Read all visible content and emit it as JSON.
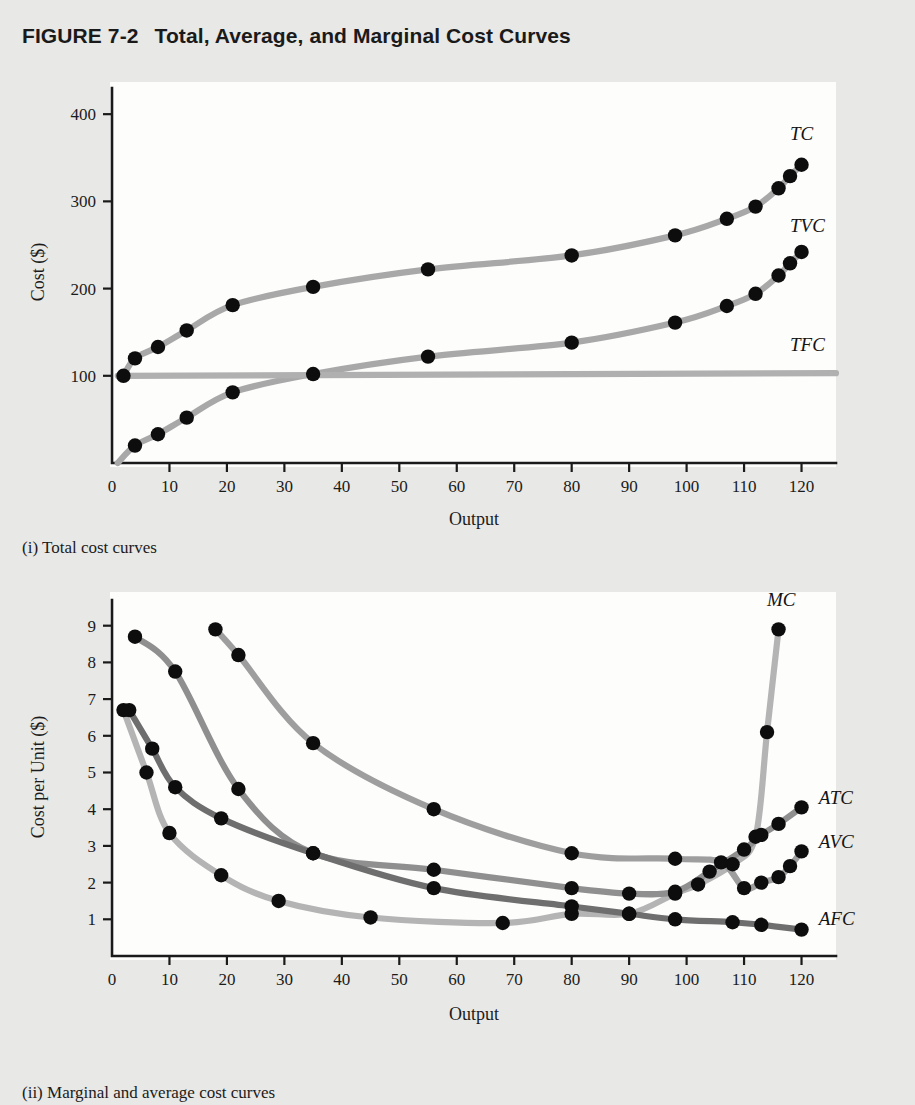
{
  "figure": {
    "number": "FIGURE 7-2",
    "title": "Total, Average, and Marginal Cost Curves"
  },
  "captions": {
    "panel_i": "(i) Total cost curves",
    "panel_ii": "(ii) Marginal and average cost curves"
  },
  "colors": {
    "page_background": "#e8e8e6",
    "plot_background": "#fdfdfc",
    "axis": "#1a1a1a",
    "point": "#0d0d0d",
    "tc": "#a8a8a8",
    "tvc": "#a8a8a8",
    "tfc": "#b0b0b0",
    "mc": "#b4b4b4",
    "atc": "#8f8f8f",
    "avc": "#9e9e9e",
    "afc": "#6e6e6e"
  },
  "chart_data": [
    {
      "type": "line",
      "id": "total-cost-curves",
      "title": "(i) Total cost curves",
      "xlabel": "Output",
      "ylabel": "Cost ($)",
      "xlim": [
        0,
        126
      ],
      "ylim": [
        0,
        430
      ],
      "xticks": [
        0,
        10,
        20,
        30,
        40,
        50,
        60,
        70,
        80,
        90,
        100,
        110,
        120
      ],
      "yticks": [
        100,
        200,
        300,
        400
      ],
      "grid": false,
      "legend_position": "inline-right",
      "series": [
        {
          "name": "TC",
          "label": "TC",
          "color": "#a8a8a8",
          "points": [
            {
              "x": 2,
              "y": 100
            },
            {
              "x": 4,
              "y": 120
            },
            {
              "x": 8,
              "y": 133
            },
            {
              "x": 13,
              "y": 152
            },
            {
              "x": 21,
              "y": 181
            },
            {
              "x": 35,
              "y": 202
            },
            {
              "x": 55,
              "y": 222
            },
            {
              "x": 80,
              "y": 238
            },
            {
              "x": 98,
              "y": 261
            },
            {
              "x": 107,
              "y": 280
            },
            {
              "x": 112,
              "y": 294
            },
            {
              "x": 116,
              "y": 315
            },
            {
              "x": 118,
              "y": 329
            },
            {
              "x": 120,
              "y": 342
            }
          ]
        },
        {
          "name": "TVC",
          "label": "TVC",
          "color": "#a8a8a8",
          "points": [
            {
              "x": 1,
              "y": 0
            },
            {
              "x": 4,
              "y": 20
            },
            {
              "x": 8,
              "y": 33
            },
            {
              "x": 13,
              "y": 52
            },
            {
              "x": 21,
              "y": 81
            },
            {
              "x": 35,
              "y": 102
            },
            {
              "x": 55,
              "y": 122
            },
            {
              "x": 80,
              "y": 138
            },
            {
              "x": 98,
              "y": 161
            },
            {
              "x": 107,
              "y": 180
            },
            {
              "x": 112,
              "y": 194
            },
            {
              "x": 116,
              "y": 215
            },
            {
              "x": 118,
              "y": 229
            },
            {
              "x": 120,
              "y": 242
            }
          ]
        },
        {
          "name": "TFC",
          "label": "TFC",
          "color": "#b0b0b0",
          "points": [
            {
              "x": 1,
              "y": 100
            },
            {
              "x": 126,
              "y": 103
            }
          ]
        }
      ],
      "curve_labels": [
        {
          "text": "TC",
          "x": 118,
          "y": 370
        },
        {
          "text": "TVC",
          "x": 118,
          "y": 265
        },
        {
          "text": "TFC",
          "x": 118,
          "y": 128
        }
      ]
    },
    {
      "type": "line",
      "id": "marginal-and-average-cost-curves",
      "title": "(ii) Marginal and average cost curves",
      "xlabel": "Output",
      "ylabel": "Cost per Unit ($)",
      "xlim": [
        0,
        126
      ],
      "ylim": [
        0,
        9.7
      ],
      "xticks": [
        0,
        10,
        20,
        30,
        40,
        50,
        60,
        70,
        80,
        90,
        100,
        110,
        120
      ],
      "yticks": [
        1,
        2,
        3,
        4,
        5,
        6,
        7,
        8,
        9
      ],
      "grid": false,
      "legend_position": "inline-right",
      "series": [
        {
          "name": "MC",
          "label": "MC",
          "color": "#b4b4b4",
          "points": [
            {
              "x": 2,
              "y": 6.7
            },
            {
              "x": 6,
              "y": 5.0
            },
            {
              "x": 10,
              "y": 3.35
            },
            {
              "x": 19,
              "y": 2.2
            },
            {
              "x": 29,
              "y": 1.5
            },
            {
              "x": 45,
              "y": 1.05
            },
            {
              "x": 68,
              "y": 0.9
            },
            {
              "x": 80,
              "y": 1.15
            },
            {
              "x": 90,
              "y": 1.15
            },
            {
              "x": 98,
              "y": 1.7
            },
            {
              "x": 102,
              "y": 1.95
            },
            {
              "x": 108,
              "y": 2.5
            },
            {
              "x": 112,
              "y": 3.25
            },
            {
              "x": 114,
              "y": 6.1
            },
            {
              "x": 116,
              "y": 8.9
            }
          ]
        },
        {
          "name": "ATC",
          "label": "ATC",
          "color": "#8f8f8f",
          "points": [
            {
              "x": 4,
              "y": 8.7
            },
            {
              "x": 11,
              "y": 7.75
            },
            {
              "x": 22,
              "y": 4.55
            },
            {
              "x": 35,
              "y": 2.8
            },
            {
              "x": 56,
              "y": 2.35
            },
            {
              "x": 80,
              "y": 1.85
            },
            {
              "x": 90,
              "y": 1.7
            },
            {
              "x": 98,
              "y": 1.75
            },
            {
              "x": 104,
              "y": 2.3
            },
            {
              "x": 110,
              "y": 2.9
            },
            {
              "x": 113,
              "y": 3.3
            },
            {
              "x": 116,
              "y": 3.6
            },
            {
              "x": 120,
              "y": 4.05
            }
          ]
        },
        {
          "name": "AVC",
          "label": "AVC",
          "color": "#9e9e9e",
          "points": [
            {
              "x": 18,
              "y": 8.9
            },
            {
              "x": 22,
              "y": 8.2
            },
            {
              "x": 35,
              "y": 5.8
            },
            {
              "x": 56,
              "y": 4.0
            },
            {
              "x": 80,
              "y": 2.8
            },
            {
              "x": 98,
              "y": 2.65
            },
            {
              "x": 106,
              "y": 2.55
            },
            {
              "x": 110,
              "y": 1.85
            },
            {
              "x": 113,
              "y": 2.0
            },
            {
              "x": 116,
              "y": 2.15
            },
            {
              "x": 118,
              "y": 2.45
            },
            {
              "x": 120,
              "y": 2.85
            }
          ]
        },
        {
          "name": "AFC",
          "label": "AFC",
          "color": "#6e6e6e",
          "points": [
            {
              "x": 3,
              "y": 6.7
            },
            {
              "x": 7,
              "y": 5.65
            },
            {
              "x": 11,
              "y": 4.6
            },
            {
              "x": 19,
              "y": 3.75
            },
            {
              "x": 35,
              "y": 2.8
            },
            {
              "x": 56,
              "y": 1.85
            },
            {
              "x": 80,
              "y": 1.35
            },
            {
              "x": 90,
              "y": 1.15
            },
            {
              "x": 98,
              "y": 1.0
            },
            {
              "x": 108,
              "y": 0.92
            },
            {
              "x": 113,
              "y": 0.85
            },
            {
              "x": 120,
              "y": 0.72
            }
          ]
        }
      ],
      "curve_labels": [
        {
          "text": "MC",
          "x": 114,
          "y": 9.55
        },
        {
          "text": "ATC",
          "x": 123,
          "y": 4.15
        },
        {
          "text": "AVC",
          "x": 123,
          "y": 2.95
        },
        {
          "text": "AFC",
          "x": 123,
          "y": 0.85
        }
      ]
    }
  ]
}
